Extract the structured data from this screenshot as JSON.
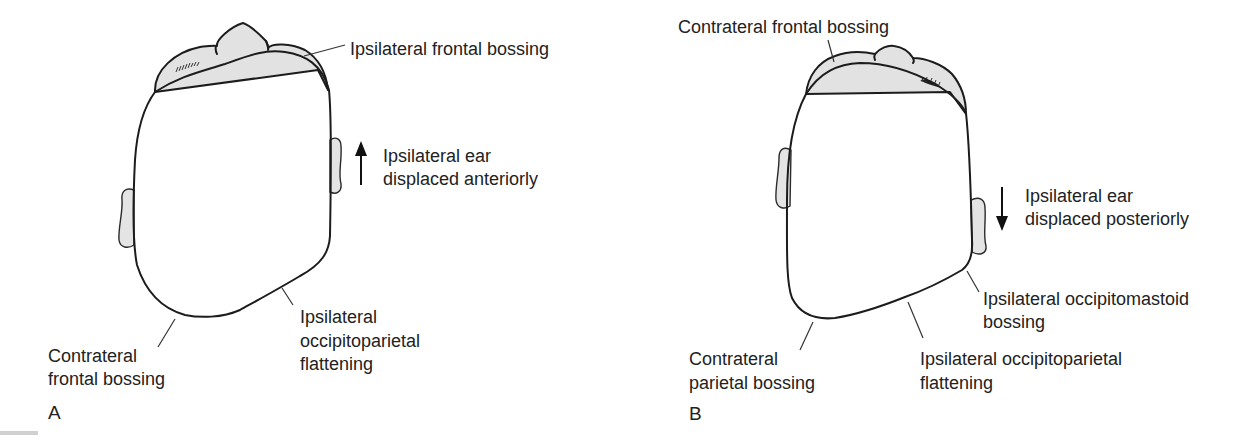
{
  "figure": {
    "type": "anatomical-illustration",
    "colors": {
      "outline": "#1c1c1c",
      "head_fill_center": "#fafafa",
      "head_fill_edge": "#dcdcdc",
      "text": "#222222",
      "background": "#ffffff"
    }
  },
  "panels": [
    {
      "id": "A",
      "letter": "A",
      "ear_arrow": {
        "direction": "up",
        "icon": "arrow-up-icon"
      },
      "labels": {
        "top_right": "Ipsilateral frontal bossing",
        "ear_line1": "Ipsilateral ear",
        "ear_line2": "displaced anteriorly",
        "bottom_left_line1": "Contrateral",
        "bottom_left_line2": "frontal bossing",
        "bottom_right_line1": "Ipsilateral",
        "bottom_right_line2": "occipitoparietal",
        "bottom_right_line3": "flattening"
      }
    },
    {
      "id": "B",
      "letter": "B",
      "ear_arrow": {
        "direction": "down",
        "icon": "arrow-down-icon"
      },
      "labels": {
        "top_left": "Contrateral frontal bossing",
        "ear_line1": "Ipsilateral ear",
        "ear_line2": "displaced posteriorly",
        "right_line1": "Ipsilateral occipitomastoid",
        "right_line2": "bossing",
        "bottom_left_line1": "Contrateral",
        "bottom_left_line2": "parietal bossing",
        "bottom_right_line1": "Ipsilateral occipitoparietal",
        "bottom_right_line2": "flattening"
      }
    }
  ]
}
